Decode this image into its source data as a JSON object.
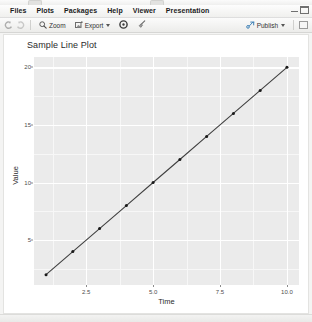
{
  "window": {
    "minimize_icon": "window-minimize-icon",
    "maximize_icon": "window-maximize-icon"
  },
  "menubar": {
    "items": [
      {
        "label": "Files",
        "name": "menu-files"
      },
      {
        "label": "Plots",
        "name": "menu-plots"
      },
      {
        "label": "Packages",
        "name": "menu-packages"
      },
      {
        "label": "Help",
        "name": "menu-help"
      },
      {
        "label": "Viewer",
        "name": "menu-viewer"
      },
      {
        "label": "Presentation",
        "name": "menu-presentation"
      }
    ]
  },
  "toolbar": {
    "back_icon": "back-arrow-icon",
    "forward_icon": "forward-arrow-icon",
    "zoom_label": "Zoom",
    "zoom_icon": "magnifier-icon",
    "export_label": "Export",
    "export_icon": "export-image-icon",
    "export_caret": "chevron-down-icon",
    "remove_icon": "remove-plot-icon",
    "clear_icon": "broom-clear-icon",
    "publish_label": "Publish",
    "publish_icon": "publish-icon",
    "publish_caret": "chevron-down-icon",
    "panel_icon": "panel-layout-icon"
  },
  "chart_data": {
    "type": "line",
    "title": "Sample Line Plot",
    "xlabel": "Time",
    "ylabel": "Value",
    "x": [
      1,
      2,
      3,
      4,
      5,
      6,
      7,
      8,
      9,
      10
    ],
    "values": [
      2,
      4,
      6,
      8,
      10,
      12,
      14,
      16,
      18,
      20
    ],
    "series": [
      {
        "name": "value",
        "values": [
          2,
          4,
          6,
          8,
          10,
          12,
          14,
          16,
          18,
          20
        ]
      }
    ],
    "xlim": [
      0.55,
      10.45
    ],
    "ylim": [
      1.1,
      20.9
    ],
    "xticks": [
      2.5,
      5.0,
      7.5,
      10.0
    ],
    "xtick_labels": [
      "2.5",
      "5.0",
      "7.5",
      "10.0"
    ],
    "yticks": [
      5,
      10,
      15,
      20
    ],
    "ytick_labels": [
      "5",
      "10",
      "15",
      "20"
    ],
    "xminor": [
      1.25,
      3.75,
      6.25,
      8.75
    ],
    "yminor": [
      2.5,
      7.5,
      12.5,
      17.5
    ],
    "grid": true,
    "legend": "none",
    "panel_background": "#ebebeb",
    "grid_color": "#ffffff",
    "line_color": "#404040",
    "point_color": "#1a1a1a",
    "marker": "circle"
  }
}
